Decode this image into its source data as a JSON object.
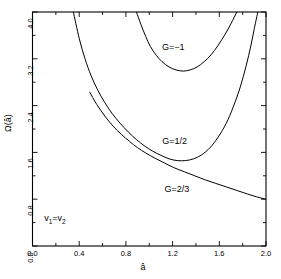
{
  "chart_data": {
    "type": "line",
    "title": "",
    "xlabel": "â",
    "ylabel": "Ω(â)",
    "xlim": [
      0.0,
      2.0
    ],
    "ylim": [
      0.0,
      4.0
    ],
    "grid": false,
    "legend_position": "inline-annotations",
    "xticks": [
      0.0,
      0.2,
      0.4,
      0.6,
      0.8,
      1.0,
      1.2,
      1.4,
      1.6,
      1.8,
      2.0
    ],
    "xtick_labels": [
      "0.0",
      "",
      "0.4",
      "",
      "0.8",
      "",
      "1.2",
      "",
      "1.6",
      "",
      "2.0"
    ],
    "yticks": [
      0.0,
      0.4,
      0.8,
      1.2,
      1.6,
      2.0,
      2.4,
      2.8,
      3.2,
      3.6,
      4.0
    ],
    "ytick_labels": [
      "0.0",
      "",
      "0.8",
      "",
      "1.6",
      "",
      "2.4",
      "",
      "3.2",
      "",
      "4.0"
    ],
    "annotations": [
      {
        "text": "G=−1",
        "x": 1.28,
        "y": 3.38
      },
      {
        "text": "G=1/2",
        "x": 1.3,
        "y": 1.77
      },
      {
        "text": "G=2/3",
        "x": 1.32,
        "y": 0.96
      },
      {
        "text": "v₁=v₂",
        "x": 0.22,
        "y": 0.45
      }
    ],
    "series": [
      {
        "name": "G=-1",
        "label": "G=−1",
        "color": "#000000",
        "points": [
          [
            0.89,
            4.0
          ],
          [
            0.93,
            3.78
          ],
          [
            0.97,
            3.58
          ],
          [
            1.01,
            3.41
          ],
          [
            1.06,
            3.26
          ],
          [
            1.11,
            3.15
          ],
          [
            1.17,
            3.06
          ],
          [
            1.23,
            3.01
          ],
          [
            1.29,
            2.99
          ],
          [
            1.35,
            3.01
          ],
          [
            1.41,
            3.06
          ],
          [
            1.47,
            3.15
          ],
          [
            1.53,
            3.27
          ],
          [
            1.59,
            3.43
          ],
          [
            1.65,
            3.62
          ],
          [
            1.7,
            3.8
          ],
          [
            1.75,
            4.0
          ]
        ]
      },
      {
        "name": "G=1/2",
        "label": "G=1/2",
        "color": "#000000",
        "points": [
          [
            0.35,
            4.0
          ],
          [
            0.4,
            3.55
          ],
          [
            0.45,
            3.2
          ],
          [
            0.5,
            2.92
          ],
          [
            0.56,
            2.66
          ],
          [
            0.62,
            2.45
          ],
          [
            0.68,
            2.27
          ],
          [
            0.75,
            2.1
          ],
          [
            0.82,
            1.95
          ],
          [
            0.89,
            1.82
          ],
          [
            0.96,
            1.71
          ],
          [
            1.03,
            1.62
          ],
          [
            1.1,
            1.55
          ],
          [
            1.17,
            1.49
          ],
          [
            1.24,
            1.46
          ],
          [
            1.31,
            1.46
          ],
          [
            1.38,
            1.49
          ],
          [
            1.45,
            1.56
          ],
          [
            1.52,
            1.68
          ],
          [
            1.59,
            1.86
          ],
          [
            1.66,
            2.1
          ],
          [
            1.72,
            2.38
          ],
          [
            1.78,
            2.72
          ],
          [
            1.83,
            3.08
          ],
          [
            1.87,
            3.42
          ],
          [
            1.9,
            3.72
          ],
          [
            1.93,
            4.0
          ]
        ]
      },
      {
        "name": "G=2/3",
        "label": "G=2/3",
        "color": "#000000",
        "points": [
          [
            0.49,
            2.63
          ],
          [
            0.55,
            2.42
          ],
          [
            0.62,
            2.22
          ],
          [
            0.69,
            2.05
          ],
          [
            0.76,
            1.91
          ],
          [
            0.83,
            1.79
          ],
          [
            0.9,
            1.68
          ],
          [
            0.97,
            1.59
          ],
          [
            1.05,
            1.5
          ],
          [
            1.13,
            1.42
          ],
          [
            1.21,
            1.34
          ],
          [
            1.3,
            1.27
          ],
          [
            1.39,
            1.2
          ],
          [
            1.48,
            1.13
          ],
          [
            1.57,
            1.07
          ],
          [
            1.66,
            1.01
          ],
          [
            1.75,
            0.95
          ],
          [
            1.84,
            0.89
          ],
          [
            1.92,
            0.84
          ],
          [
            2.0,
            0.8
          ]
        ]
      }
    ]
  },
  "axes": {
    "y_title": "Ω(â)",
    "x_title": "â"
  },
  "labels": {
    "curve_neg1": "G=−1",
    "curve_half": "G=1/2",
    "curve_twothirds": "G=2/3",
    "condition": "v",
    "condition_sub1": "1",
    "condition_eq": "=v",
    "condition_sub2": "2"
  },
  "style": {
    "line_color": "#000000",
    "axis_color": "#000000",
    "background": "#ffffff"
  }
}
